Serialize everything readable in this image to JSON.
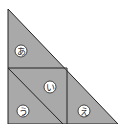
{
  "diagram": {
    "fill_color": "#a9a9a9",
    "line_color": "#222222",
    "regions": [
      {
        "id": "a",
        "label": "あ",
        "cx": 21,
        "cy": 51
      },
      {
        "id": "i",
        "label": "い",
        "cx": 50,
        "cy": 87
      },
      {
        "id": "u",
        "label": "う",
        "cx": 23,
        "cy": 111
      },
      {
        "id": "e",
        "label": "え",
        "cx": 84,
        "cy": 111
      }
    ]
  }
}
